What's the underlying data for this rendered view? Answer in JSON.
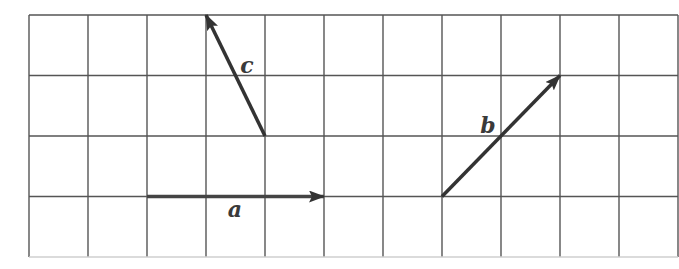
{
  "diagram": {
    "type": "vector-grid",
    "grid": {
      "origin_x": 29,
      "origin_y": 15,
      "cell_w": 59,
      "cell_h": 60.5,
      "cols": 11,
      "rows": 4,
      "line_color": "#555555"
    },
    "vectors": [
      {
        "id": "a",
        "label": "a",
        "from": [
          2,
          3
        ],
        "to": [
          5,
          3
        ],
        "label_pos": [
          235,
          217
        ],
        "color": "#444444"
      },
      {
        "id": "b",
        "label": "b",
        "from": [
          7,
          3
        ],
        "to": [
          9,
          1
        ],
        "label_pos": [
          488,
          133
        ],
        "color": "#333333"
      },
      {
        "id": "c",
        "label": "c",
        "from": [
          4,
          2
        ],
        "to": [
          3,
          0
        ],
        "label_pos": [
          247,
          73
        ],
        "color": "#333333"
      }
    ]
  }
}
